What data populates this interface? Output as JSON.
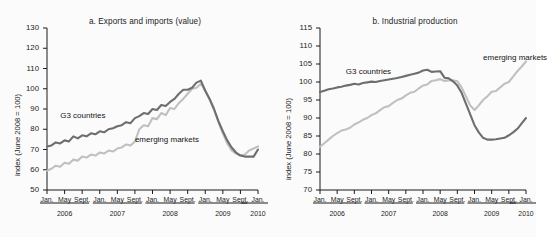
{
  "figure": {
    "background": "#fbfbfb",
    "panel_count": 2
  },
  "colors": {
    "g3": "#6e6e6e",
    "emerging": "#c0c0c0",
    "axis": "#1b1b1b",
    "text": "#1b1b1b"
  },
  "xaxis": {
    "month_ticks": [
      "Jan.",
      "May",
      "Sept.",
      "Jan.",
      "May",
      "Sept.",
      "Jan.",
      "May",
      "Sept.",
      "Jan.",
      "May",
      "Sept.",
      "Jan."
    ],
    "year_ticks": [
      "2006",
      "2007",
      "2008",
      "2009",
      "2010"
    ]
  },
  "chart_data": [
    {
      "type": "line",
      "title": "a.  Exports and imports (value)",
      "xlabel": "",
      "ylabel": "index (June 2008 = 100)",
      "ylim": [
        50,
        130
      ],
      "yticks": [
        50,
        60,
        70,
        80,
        90,
        100,
        110,
        120,
        130
      ],
      "xlim": [
        "2006-01",
        "2010-01"
      ],
      "grid": false,
      "legend": "inline-annotation",
      "annotations": [
        {
          "text": "G3 countries",
          "x": "2006-04",
          "y": 86
        },
        {
          "text": "emerging markets",
          "x": "2007-09",
          "y": 74
        }
      ],
      "x": [
        "2006-01",
        "2006-02",
        "2006-03",
        "2006-04",
        "2006-05",
        "2006-06",
        "2006-07",
        "2006-08",
        "2006-09",
        "2006-10",
        "2006-11",
        "2006-12",
        "2007-01",
        "2007-02",
        "2007-03",
        "2007-04",
        "2007-05",
        "2007-06",
        "2007-07",
        "2007-08",
        "2007-09",
        "2007-10",
        "2007-11",
        "2007-12",
        "2008-01",
        "2008-02",
        "2008-03",
        "2008-04",
        "2008-05",
        "2008-06",
        "2008-07",
        "2008-08",
        "2008-09",
        "2008-10",
        "2008-11",
        "2008-12",
        "2009-01",
        "2009-02",
        "2009-03",
        "2009-04",
        "2009-05",
        "2009-06",
        "2009-07",
        "2009-08",
        "2009-09",
        "2009-10",
        "2009-11",
        "2009-12",
        "2010-01"
      ],
      "series": [
        {
          "name": "G3 countries",
          "color": "#6e6e6e",
          "values": [
            71.5,
            72.0,
            73.5,
            73.0,
            74.5,
            74.0,
            76.5,
            75.5,
            77.0,
            76.5,
            78.0,
            77.5,
            79.0,
            78.5,
            80.0,
            80.5,
            81.5,
            82.0,
            83.5,
            83.0,
            85.5,
            86.5,
            88.0,
            87.5,
            90.0,
            89.5,
            92.0,
            91.5,
            93.5,
            95.0,
            97.5,
            99.5,
            99.5,
            100.5,
            103.0,
            104.0,
            99.0,
            95.0,
            90.0,
            84.0,
            79.0,
            74.5,
            71.0,
            68.5,
            67.0,
            66.5,
            66.5,
            66.5,
            70.0,
            69.0,
            72.0,
            72.5,
            74.0,
            76.5,
            78.0,
            79.0,
            80.5
          ]
        },
        {
          "name": "emerging markets",
          "color": "#c0c0c0",
          "values": [
            59.5,
            60.5,
            62.0,
            61.5,
            63.5,
            63.0,
            65.0,
            64.5,
            66.5,
            66.0,
            67.5,
            67.0,
            68.5,
            68.0,
            69.5,
            69.0,
            70.5,
            71.0,
            72.5,
            72.0,
            74.0,
            80.0,
            82.0,
            81.5,
            85.5,
            85.0,
            88.0,
            87.0,
            90.5,
            90.0,
            93.0,
            95.0,
            97.5,
            100.0,
            100.5,
            102.5,
            99.0,
            94.5,
            89.5,
            83.5,
            78.0,
            73.0,
            69.5,
            68.0,
            67.0,
            67.5,
            69.5,
            70.5,
            71.5,
            71.0,
            73.0,
            74.0,
            76.0,
            78.0,
            82.0,
            91.0,
            88.0
          ]
        }
      ]
    },
    {
      "type": "line",
      "title": "b.  Industrial production",
      "xlabel": "",
      "ylabel": "index (June 2008 = 100)",
      "ylim": [
        70,
        115
      ],
      "yticks": [
        70,
        75,
        80,
        85,
        90,
        95,
        100,
        105,
        110,
        115
      ],
      "xlim": [
        "2006-01",
        "2010-01"
      ],
      "grid": false,
      "legend": "inline-annotation",
      "annotations": [
        {
          "text": "G3 countries",
          "x": "2006-07",
          "y": 102.5
        },
        {
          "text": "emerging markets",
          "x": "2009-03",
          "y": 106.5
        }
      ],
      "x": [
        "2006-01",
        "2006-02",
        "2006-03",
        "2006-04",
        "2006-05",
        "2006-06",
        "2006-07",
        "2006-08",
        "2006-09",
        "2006-10",
        "2006-11",
        "2006-12",
        "2007-01",
        "2007-02",
        "2007-03",
        "2007-04",
        "2007-05",
        "2007-06",
        "2007-07",
        "2007-08",
        "2007-09",
        "2007-10",
        "2007-11",
        "2007-12",
        "2008-01",
        "2008-02",
        "2008-03",
        "2008-04",
        "2008-05",
        "2008-06",
        "2008-07",
        "2008-08",
        "2008-09",
        "2008-10",
        "2008-11",
        "2008-12",
        "2009-01",
        "2009-02",
        "2009-03",
        "2009-04",
        "2009-05",
        "2009-06",
        "2009-07",
        "2009-08",
        "2009-09",
        "2009-10",
        "2009-11",
        "2009-12",
        "2010-01"
      ],
      "series": [
        {
          "name": "G3 countries",
          "color": "#6e6e6e",
          "values": [
            97.2,
            97.6,
            98.0,
            98.2,
            98.5,
            98.7,
            99.0,
            99.2,
            99.5,
            99.3,
            99.7,
            99.9,
            100.1,
            100.0,
            100.3,
            100.5,
            100.7,
            100.9,
            101.1,
            101.4,
            101.7,
            102.0,
            102.3,
            102.6,
            103.2,
            103.4,
            102.8,
            102.9,
            103.0,
            101.2,
            101.0,
            100.2,
            99.0,
            97.0,
            94.0,
            91.0,
            88.0,
            86.0,
            84.5,
            84.0,
            84.0,
            84.1,
            84.3,
            84.5,
            85.2,
            86.0,
            87.0,
            88.5,
            90.0
          ]
        },
        {
          "name": "emerging markets",
          "color": "#c0c0c0",
          "values": [
            82.0,
            83.0,
            84.0,
            85.0,
            85.8,
            86.5,
            86.8,
            87.3,
            88.2,
            88.8,
            89.5,
            90.0,
            90.8,
            91.3,
            92.2,
            93.0,
            93.3,
            94.2,
            95.0,
            95.4,
            96.3,
            97.0,
            97.3,
            98.2,
            99.0,
            99.3,
            100.3,
            100.5,
            100.8,
            100.3,
            100.4,
            100.5,
            100.2,
            98.5,
            96.0,
            93.5,
            92.2,
            93.5,
            95.0,
            96.0,
            97.3,
            97.5,
            98.5,
            99.5,
            100.0,
            101.5,
            103.0,
            104.3,
            105.7
          ]
        }
      ]
    }
  ]
}
